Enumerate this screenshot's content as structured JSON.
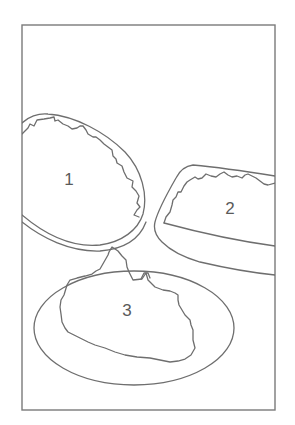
{
  "diagram": {
    "colors": {
      "line": "#6e6e6e",
      "background": "#ffffff",
      "label": "#5a5a5a"
    },
    "items": [
      {
        "label": "1",
        "shape": "oval bowl tilted, cut off by left frame edge"
      },
      {
        "label": "2",
        "shape": "rectangular baking dish, cut off by right frame edge"
      },
      {
        "label": "3",
        "shape": "oval plate with irregular food mound"
      }
    ]
  }
}
